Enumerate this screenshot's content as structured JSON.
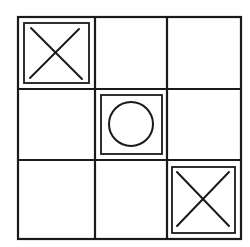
{
  "game": {
    "name": "Tic-Tac-Toe",
    "board": [
      [
        "X",
        "",
        ""
      ],
      [
        "",
        "O",
        ""
      ],
      [
        "",
        "",
        "X"
      ]
    ],
    "highlighted_cells": [
      [
        0,
        0
      ],
      [
        1,
        1
      ],
      [
        2,
        2
      ]
    ]
  },
  "colors": {
    "line": "#1a1a1a",
    "background": "#ffffff"
  }
}
